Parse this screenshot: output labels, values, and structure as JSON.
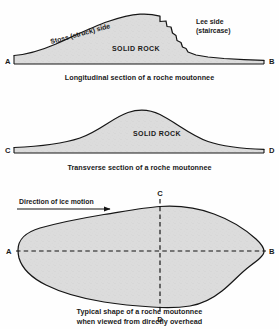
{
  "figure": {
    "background_color": "#fefefe",
    "rock_fill_color": "#dcdcdc",
    "line_color": "#161616"
  },
  "panels": {
    "longitudinal": {
      "caption": "Longitudinal section of a roche moutonnee",
      "rock_label": "SOLID ROCK",
      "left_endpoint": "A",
      "right_endpoint": "B",
      "stoss_label": "Stoss (struck) side",
      "lee_label_line1": "Lee side",
      "lee_label_line2": "(staircase)"
    },
    "transverse": {
      "caption": "Transverse section of a roche moutonnee",
      "rock_label": "SOLID ROCK",
      "left_endpoint": "C",
      "right_endpoint": "D"
    },
    "plan": {
      "caption_line1": "Typical shape of a roche moutonnee",
      "caption_line2": "when viewed from directly overhead",
      "ice_direction_label": "Direction of ice motion",
      "left_endpoint": "A",
      "right_endpoint": "B",
      "top_endpoint": "C",
      "bottom_endpoint": "D"
    }
  }
}
